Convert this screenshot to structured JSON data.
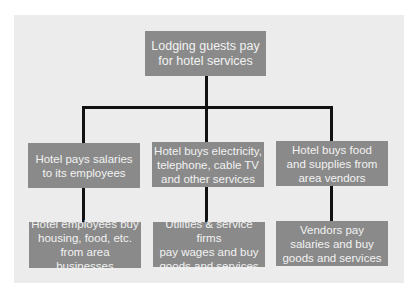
{
  "diagram": {
    "type": "flowchart",
    "colors": {
      "background": "#ffffff",
      "panel": "#ececec",
      "box_fill": "#8a8a8a",
      "box_text": "#f2f2f2",
      "connector": "#111111"
    },
    "root": {
      "label": "Lodging guests pay\nfor hotel services"
    },
    "branches": [
      {
        "label": "Hotel pays salaries\nto its employees",
        "child": {
          "label": "Hotel employees buy\nhousing, food, etc.\nfrom area businesses"
        }
      },
      {
        "label": "Hotel buys electricity,\ntelephone, cable TV\nand other services",
        "child": {
          "label": "Utilities & service firms\npay wages and buy\ngoods and services"
        }
      },
      {
        "label": "Hotel buys food\nand supplies from\narea vendors",
        "child": {
          "label": "Vendors pay\nsalaries and buy\ngoods and services"
        }
      }
    ]
  }
}
